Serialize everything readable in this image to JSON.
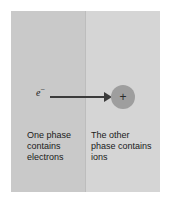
{
  "figure": {
    "name": "two-phase-charge-transfer-diagram",
    "background_color": "#ffffff"
  },
  "phases": {
    "left": {
      "caption": "One phase\ncontains\nelectrons",
      "fill_color": "#c9c9c9"
    },
    "right": {
      "caption": "The other\nphase contains\nions",
      "fill_color": "#d5d5d5"
    },
    "boundary_color": "#bdbdbd"
  },
  "annotations": {
    "electron_symbol": "e",
    "electron_charge_superscript": "−",
    "arrow_color": "#3b3b3b",
    "ion": {
      "charge_symbol": "+",
      "fill_color": "#9e9e9e"
    }
  }
}
